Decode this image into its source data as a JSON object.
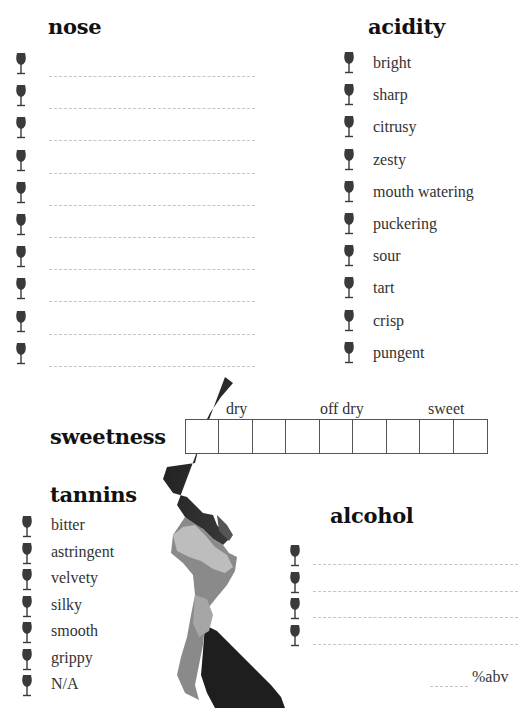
{
  "nose": {
    "title": "nose",
    "line_count": 10
  },
  "acidity": {
    "title": "acidity",
    "items": [
      "bright",
      "sharp",
      "citrusy",
      "zesty",
      "mouth watering",
      "puckering",
      "sour",
      "tart",
      "crisp",
      "pungent"
    ]
  },
  "sweetness": {
    "title": "sweetness",
    "scale_labels": [
      "dry",
      "off dry",
      "sweet"
    ],
    "box_count": 9
  },
  "tannins": {
    "title": "tannins",
    "items": [
      "bitter",
      "astringent",
      "velvety",
      "silky",
      "smooth",
      "grippy",
      "N/A"
    ]
  },
  "alcohol": {
    "title": "alcohol",
    "line_count": 4,
    "abv_label": "%abv"
  },
  "icons": {
    "bullet": "wine-glass-icon"
  },
  "colors": {
    "glass": "#3a3a3a",
    "dash": "#c4c4c4",
    "heading": "#111111"
  }
}
